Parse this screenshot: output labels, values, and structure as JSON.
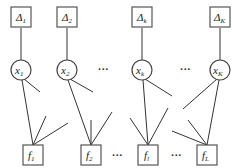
{
  "diagram": {
    "type": "factor-graph",
    "top_nodes": [
      {
        "id": "delta1",
        "symbol": "Δ",
        "sub": "1",
        "cx": 21
      },
      {
        "id": "delta2",
        "symbol": "Δ",
        "sub": "2",
        "cx": 67
      },
      {
        "id": "deltak",
        "symbol": "Δ",
        "sub": "k",
        "cx": 142
      },
      {
        "id": "deltaK",
        "symbol": "Δ",
        "sub": "K",
        "cx": 220
      }
    ],
    "variable_nodes": [
      {
        "id": "x1",
        "symbol": "x",
        "sub": "1",
        "cx": 21
      },
      {
        "id": "x2",
        "symbol": "x",
        "sub": "2",
        "cx": 67
      },
      {
        "id": "xk",
        "symbol": "x",
        "sub": "k",
        "cx": 142
      },
      {
        "id": "xK",
        "symbol": "x",
        "sub": "K",
        "cx": 220
      }
    ],
    "factor_nodes": [
      {
        "id": "f1",
        "symbol": "f",
        "sub": "1",
        "cx": 33
      },
      {
        "id": "f2",
        "symbol": "f",
        "sub": "2",
        "cx": 91
      },
      {
        "id": "fl",
        "symbol": "f",
        "sub": "l",
        "cx": 148
      },
      {
        "id": "fL",
        "symbol": "f",
        "sub": "L",
        "cx": 207
      }
    ],
    "ellipsis": "···"
  }
}
